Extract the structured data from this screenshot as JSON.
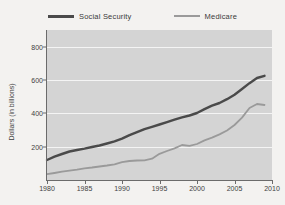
{
  "chart_data": {
    "type": "line",
    "title": "",
    "xlabel": "",
    "ylabel": "Dollars (in billions)",
    "xlim": [
      1980,
      2010
    ],
    "ylim": [
      0,
      900
    ],
    "xticks": [
      1980,
      1985,
      1990,
      1995,
      2000,
      2005,
      2010
    ],
    "yticks": [
      200,
      400,
      600,
      800
    ],
    "grid": "horizontal",
    "legend_position": "top-center",
    "plot_background": "#d4d4d4",
    "gridline_color": "#f4f4f4",
    "x": [
      1980,
      1981,
      1982,
      1983,
      1984,
      1985,
      1986,
      1987,
      1988,
      1989,
      1990,
      1991,
      1992,
      1993,
      1994,
      1995,
      1996,
      1997,
      1998,
      1999,
      2000,
      2001,
      2002,
      2003,
      2004,
      2005,
      2006,
      2007,
      2008,
      2009
    ],
    "series": [
      {
        "name": "Social Security",
        "color": "#4a4a4a",
        "values": [
          120,
          140,
          156,
          171,
          180,
          188,
          198,
          207,
          219,
          232,
          248,
          269,
          287,
          305,
          319,
          333,
          347,
          362,
          376,
          387,
          402,
          425,
          446,
          462,
          485,
          512,
          546,
          581,
          612,
          625
        ]
      },
      {
        "name": "Medicare",
        "color": "#9a9a9a",
        "values": [
          35,
          42,
          50,
          56,
          62,
          70,
          75,
          81,
          87,
          94,
          107,
          114,
          117,
          118,
          128,
          157,
          174,
          190,
          210,
          205,
          216,
          238,
          254,
          274,
          297,
          330,
          374,
          432,
          456,
          450
        ]
      }
    ]
  },
  "legend": {
    "entries": [
      {
        "label": "Social Security",
        "color": "#4a4a4a"
      },
      {
        "label": "Medicare",
        "color": "#9a9a9a"
      }
    ]
  },
  "axes": {
    "y_axis_title": "Dollars (in billions)",
    "y_tick_labels": [
      "200",
      "400",
      "600",
      "800"
    ],
    "x_tick_labels": [
      "1980",
      "1985",
      "1990",
      "1995",
      "2000",
      "2005",
      "2010"
    ]
  }
}
